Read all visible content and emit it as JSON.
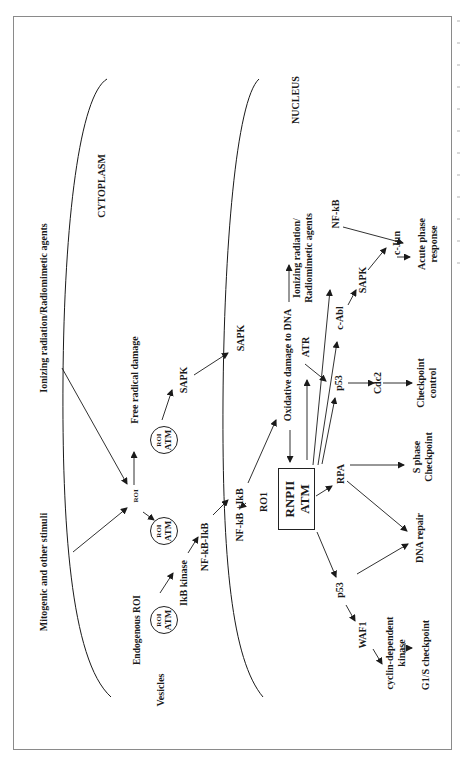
{
  "diagram": {
    "orientation": "rotated -90 degrees (text reads bottom-to-top)",
    "regions": {
      "cytoplasm": "CYTOPLASM",
      "nucleus": "NUCLEUS"
    },
    "stimuli": {
      "mitogenic": "Mitogenic and other stimuli",
      "ionizing_outer": "Ionizing radiation/Radiomimetic agents",
      "ionizing_nucleus": "Ionizing radiation/\nRadiomimetic agents"
    },
    "cytoplasm_nodes": {
      "vesicles": "Vesicles",
      "endogenous_roi": "Endogenous ROI",
      "roi_atm_1": {
        "top": "ROI",
        "bottom": "ATM"
      },
      "roi_atm_2": {
        "top": "ROI",
        "bottom": "ATM"
      },
      "roi_atm_3": {
        "top": "ROI",
        "bottom": "ATM"
      },
      "roi": "ROI",
      "ikb_kinase": "IkB kinase",
      "nfkb_ikb": "NF-kB-IkB",
      "free_radical": "Free radical damage",
      "sapk_cyto": "SAPK"
    },
    "nucleus_nodes": {
      "nfkb_plus_ikb": "NF-kB   +IkB",
      "sapk_membrane": "SAPK",
      "roi1": "RO1",
      "oxidative_damage": "Oxidative damage to DNA",
      "central_box": {
        "top": "RNPII",
        "bottom": "ATM"
      },
      "atr": "ATR",
      "p53_upper": "p53",
      "c_abl": "c-Abl",
      "sapk_nuc": "SAPK",
      "c_jun": "c-Jun",
      "nfkb": "NF-kB",
      "acute_phase": "Acute phase\nresponse",
      "cdc2": "Cdc2",
      "checkpoint_control": "Checkpoint\ncontrol",
      "rpa": "RPA",
      "s_phase": "S phase\nCheckpoint",
      "dna_repair": "DNA repair",
      "p53_lower": "p53",
      "waf1": "WAF1",
      "cdk": "cyclin-dependent\nkinase",
      "g1s": "G1/S checkpoint"
    },
    "colors": {
      "ink": "#1a1a1a",
      "frame": "#8a8a8a",
      "background": "#ffffff"
    }
  }
}
